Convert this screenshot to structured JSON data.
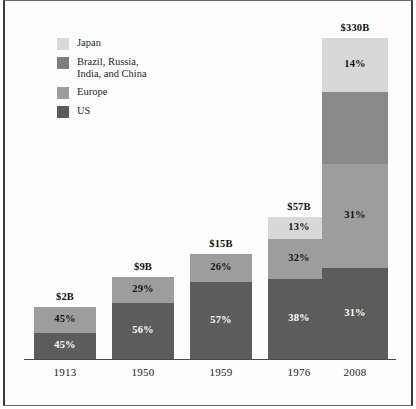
{
  "chart_data": {
    "type": "bar",
    "subtype": "stacked-bar",
    "title": "",
    "subtitle": "",
    "xlabel": "",
    "ylabel": "",
    "grid": false,
    "legend_position": "top-left",
    "stacked": true,
    "units": "billions of US dollars",
    "categories": [
      "1913",
      "1950",
      "1959",
      "1976",
      "2008"
    ],
    "totals_labels": [
      "$2B",
      "$9B",
      "$15B",
      "$57B",
      "$330B"
    ],
    "totals_values": [
      2,
      9,
      15,
      57,
      330
    ],
    "series": [
      {
        "name": "US",
        "color": "#5c5c5c",
        "values": [
          45,
          56,
          57,
          38,
          31
        ],
        "labels": [
          "45%",
          "56%",
          "57%",
          "38%",
          "31%"
        ],
        "label_style": [
          "light",
          "light",
          "light",
          "light",
          "light"
        ]
      },
      {
        "name": "Europe",
        "color": "#9d9d9d",
        "values": [
          45,
          29,
          26,
          32,
          31
        ],
        "labels": [
          "45%",
          "29%",
          "26%",
          "32%",
          "31%"
        ],
        "label_style": [
          "dark",
          "dark",
          "dark",
          "dark",
          "dark"
        ]
      },
      {
        "name": "Brazil, Russia, India, and China",
        "color": "#898989",
        "values": [
          0,
          0,
          0,
          0,
          24
        ],
        "labels": [
          "",
          "",
          "",
          "",
          ""
        ],
        "label_style": [
          "dark",
          "dark",
          "dark",
          "dark",
          "dark"
        ]
      },
      {
        "name": "Japan",
        "color": "#d8d8d8",
        "values": [
          0,
          0,
          0,
          13,
          14
        ],
        "labels": [
          "",
          "",
          "",
          "13%",
          "14%"
        ],
        "label_style": [
          "dark",
          "dark",
          "dark",
          "dark",
          "dark"
        ]
      }
    ]
  },
  "legend": {
    "items": [
      {
        "label": "Japan",
        "color": "#d8d8d8"
      },
      {
        "label": "Brazil, Russia,\nIndia, and China",
        "color": "#7d7d7d"
      },
      {
        "label": "Europe",
        "color": "#9d9d9d"
      },
      {
        "label": "US",
        "color": "#5c5c5c"
      }
    ]
  },
  "bars": [
    {
      "category": "1913",
      "total_label": "$2B",
      "x": 34,
      "width": 62,
      "height": 52,
      "top_label_offset": 18,
      "segments": [
        {
          "name": "Europe",
          "label": "45%",
          "height": 26,
          "color": "#9d9d9d",
          "label_style": "dark"
        },
        {
          "name": "US",
          "label": "45%",
          "height": 26,
          "color": "#5c5c5c",
          "label_style": "light"
        }
      ]
    },
    {
      "category": "1950",
      "total_label": "$9B",
      "x": 112,
      "width": 62,
      "height": 82,
      "top_label_offset": 18,
      "segments": [
        {
          "name": "Europe",
          "label": "29%",
          "height": 26,
          "color": "#9d9d9d",
          "label_style": "dark"
        },
        {
          "name": "US",
          "label": "56%",
          "height": 56,
          "color": "#5c5c5c",
          "label_style": "light"
        }
      ]
    },
    {
      "category": "1959",
      "total_label": "$15B",
      "x": 190,
      "width": 62,
      "height": 105,
      "top_label_offset": 18,
      "segments": [
        {
          "name": "Europe",
          "label": "26%",
          "height": 28,
          "color": "#9d9d9d",
          "label_style": "dark"
        },
        {
          "name": "US",
          "label": "57%",
          "height": 77,
          "color": "#5c5c5c",
          "label_style": "light"
        }
      ]
    },
    {
      "category": "1976",
      "total_label": "$57B",
      "x": 268,
      "width": 62,
      "height": 142,
      "top_label_offset": 18,
      "segments": [
        {
          "name": "Japan",
          "label": "13%",
          "height": 22,
          "color": "#d8d8d8",
          "label_style": "dark"
        },
        {
          "name": "Europe",
          "label": "32%",
          "height": 40,
          "color": "#9d9d9d",
          "label_style": "dark"
        },
        {
          "name": "US",
          "label": "38%",
          "height": 80,
          "color": "#5c5c5c",
          "label_style": "light"
        }
      ]
    },
    {
      "category": "2008",
      "total_label": "$330B",
      "x": 322,
      "width": 66,
      "height": 321,
      "top_label_offset": 18,
      "segments": [
        {
          "name": "Japan",
          "label": "14%",
          "height": 54,
          "color": "#d8d8d8",
          "label_style": "dark"
        },
        {
          "name": "Brazil, Russia, India, and China",
          "label": "",
          "height": 72,
          "color": "#898989",
          "label_style": "dark"
        },
        {
          "name": "Europe",
          "label": "31%",
          "height": 104,
          "color": "#9d9d9d",
          "label_style": "dark"
        },
        {
          "name": "US",
          "label": "31%",
          "height": 91,
          "color": "#5c5c5c",
          "label_style": "light"
        }
      ]
    }
  ],
  "x_axis": {
    "ticks": [
      "1913",
      "1950",
      "1959",
      "1976",
      "2008"
    ]
  }
}
